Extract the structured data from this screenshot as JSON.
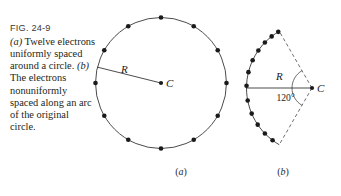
{
  "figure": {
    "fig_number": "FIG. 24-9",
    "caption_parts": {
      "a_marker": "(a)",
      "a_text": " Twelve electrons uniformly spaced around a circle. ",
      "b_marker": "(b)",
      "b_text": " The electrons nonuniformly spaced along an arc of the original circle."
    },
    "caption_full": "(a) Twelve electrons uniformly spaced around a circle. (b) The electrons nonuniformly spaced along an arc of the original circle."
  },
  "panel_a": {
    "label": "(a)",
    "label_open": "(",
    "label_letter": "a",
    "label_close": ")",
    "radius_label": "R",
    "center_label": "C",
    "electron_count": 12,
    "description": "twelve electrons uniformly spaced around a circle",
    "geometry": {
      "center_x": 161,
      "center_y": 83,
      "radius": 65.5,
      "electron_angles_deg": [
        90,
        60,
        30,
        0,
        330,
        300,
        270,
        240,
        210,
        180,
        150,
        120
      ],
      "radius_line_angle_deg": 166
    }
  },
  "panel_b": {
    "label": "(b)",
    "label_open": "(",
    "label_letter": "b",
    "label_close": ")",
    "radius_label": "R",
    "center_label": "C",
    "angle_label": "120°",
    "electron_count": 12,
    "description": "electrons nonuniformly spaced along a 120 degree arc of the original circle",
    "geometry": {
      "center_x": 312,
      "center_y": 88,
      "radius": 65.5,
      "arc_span_deg": 120,
      "arc_start_deg": 120,
      "arc_end_deg": 240,
      "electron_angles_deg": [
        121,
        128,
        136,
        145,
        155,
        166,
        178,
        191,
        203,
        214,
        224,
        233
      ],
      "radius_line_angle_deg": 180
    }
  },
  "colors": {
    "background": "#ffffff",
    "ink": "#231f20",
    "curve": "#2b2b2b",
    "dot": "#1a1a1a",
    "dash": "#4a4a4a",
    "fig_label": "#3a3a3a"
  }
}
